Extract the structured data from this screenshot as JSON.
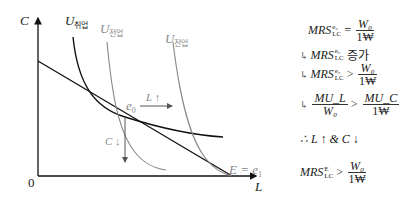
{
  "graph": {
    "axis_y_label": "C",
    "axis_x_label": "L",
    "origin_label": "0",
    "curves": [
      {
        "name": "U",
        "sub": "취업",
        "color": "#111111"
      },
      {
        "name": "U",
        "sub": "전업",
        "color": "#888888"
      },
      {
        "name": "U",
        "sub": "전업",
        "color": "#888888"
      }
    ],
    "point_e0": "e",
    "point_e0_sub": "0",
    "arrow_L_label": "L ↑",
    "arrow_C_label": "C ↓",
    "point_E": "E = e",
    "point_E_sub": "1"
  },
  "notes": {
    "line1": {
      "lhs": "MRS",
      "sup": "e₀",
      "sub": "LC",
      "op": "=",
      "num": "W₀",
      "den": "1₩"
    },
    "line2": {
      "prefix": "↳",
      "lhs": "MRS",
      "sup": "e₀",
      "sub": "LC",
      "text": "증가"
    },
    "line3": {
      "prefix": "↳",
      "lhs": "MRS",
      "sup": "e₀",
      "sub": "LC",
      "op": ">",
      "num": "W₀",
      "den": "1₩"
    },
    "line4": {
      "prefix": "↳",
      "num1": "MU_L",
      "den1": "W₀",
      "op": ">",
      "num2": "MU_C",
      "den2": "1₩"
    },
    "line5": "∴ L ↑ & C ↓",
    "line6": {
      "lhs": "MRS",
      "sup": "E",
      "sub": "LC",
      "op": ">",
      "num": "W₀",
      "den": "1₩"
    }
  }
}
